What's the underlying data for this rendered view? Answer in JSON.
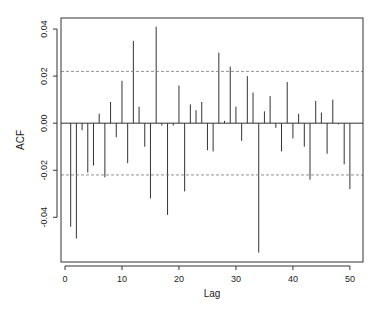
{
  "chart_data": {
    "type": "bar",
    "subtype": "acf-stem",
    "title": "",
    "xlabel": "Lag",
    "ylabel": "ACF",
    "xlim": [
      -0.7,
      52.3
    ],
    "ylim": [
      -0.059,
      0.0447
    ],
    "x_ticks": [
      0,
      10,
      20,
      30,
      40,
      50
    ],
    "x_tick_labels": [
      "0",
      "10",
      "20",
      "30",
      "40",
      "50"
    ],
    "y_ticks": [
      0.04,
      0.02,
      0.0,
      -0.02,
      -0.04
    ],
    "y_tick_labels": [
      "0.04",
      "0.02",
      "0.00",
      "-0.02",
      "-0.04"
    ],
    "confidence_bounds": [
      0.022,
      -0.022
    ],
    "grid": false,
    "legend": null,
    "x": [
      1,
      2,
      3,
      4,
      5,
      6,
      7,
      8,
      9,
      10,
      11,
      12,
      13,
      14,
      15,
      16,
      17,
      18,
      19,
      20,
      21,
      22,
      23,
      24,
      25,
      26,
      27,
      28,
      29,
      30,
      31,
      32,
      33,
      34,
      35,
      36,
      37,
      38,
      39,
      40,
      41,
      42,
      43,
      44,
      45,
      46,
      47,
      48,
      49,
      50
    ],
    "values": [
      -0.044,
      -0.049,
      -0.003,
      -0.021,
      -0.018,
      0.004,
      -0.023,
      0.009,
      -0.006,
      0.018,
      -0.017,
      0.035,
      0.007,
      -0.01,
      -0.032,
      0.041,
      -0.001,
      -0.039,
      -0.001,
      0.016,
      -0.029,
      0.008,
      0.0055,
      0.009,
      -0.0115,
      -0.012,
      0.03,
      0.001,
      0.024,
      0.007,
      -0.0075,
      0.02,
      0.013,
      -0.055,
      0.005,
      0.0115,
      -0.002,
      -0.012,
      0.0175,
      -0.0065,
      0.004,
      -0.01,
      -0.024,
      0.0095,
      0.0045,
      -0.013,
      0.01,
      -0.0005,
      -0.0175,
      -0.028
    ]
  }
}
